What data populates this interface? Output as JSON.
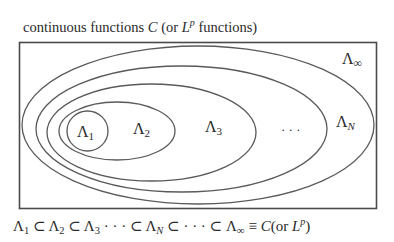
{
  "diagram": {
    "title": {
      "prefix": "continuous functions ",
      "symbol_C": "C",
      "middle": " (or ",
      "symbol_L": "L",
      "sup_p": "p",
      "suffix": " functions)"
    },
    "frame": {
      "stroke": "#4a4a4a"
    },
    "ellipse_stroke": "#5a5a5a",
    "sets": [
      {
        "id": "lambda-1",
        "base": "Λ",
        "sub": "1"
      },
      {
        "id": "lambda-2",
        "base": "Λ",
        "sub": "2"
      },
      {
        "id": "lambda-3",
        "base": "Λ",
        "sub": "3"
      },
      {
        "id": "lambda-n",
        "base": "Λ",
        "sub": "N"
      },
      {
        "id": "lambda-inf",
        "base": "Λ",
        "sub": "∞"
      }
    ],
    "ellipsis": "· · ·",
    "formula": {
      "l1": "Λ",
      "s1": "1",
      "sub1": " ⊂ ",
      "l2": "Λ",
      "s2": "2",
      "sub2": " ⊂ ",
      "l3": "Λ",
      "s3": "3",
      "dots1": " · · · ⊂ ",
      "ln": "Λ",
      "sn": "N",
      "dots2": " ⊂ · · · ⊂ ",
      "linf": "Λ",
      "sinf": "∞",
      "equiv": " ≡ ",
      "C": "C",
      "tail_open": "(or ",
      "L": "L",
      "p": "p",
      "tail_close": ")"
    }
  }
}
